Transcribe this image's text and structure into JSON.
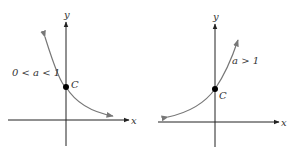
{
  "graphs": [
    {
      "axis_x_label": "x",
      "axis_y_label": "y",
      "condition_label": "0 < a < 1",
      "intercept_label": "C",
      "behavior": "decreasing exponential"
    },
    {
      "axis_x_label": "x",
      "axis_y_label": "y",
      "condition_label": "a > 1",
      "intercept_label": "C",
      "behavior": "increasing exponential"
    }
  ],
  "colors": {
    "axis": "#222222",
    "curve": "#777777",
    "point": "#000000"
  }
}
